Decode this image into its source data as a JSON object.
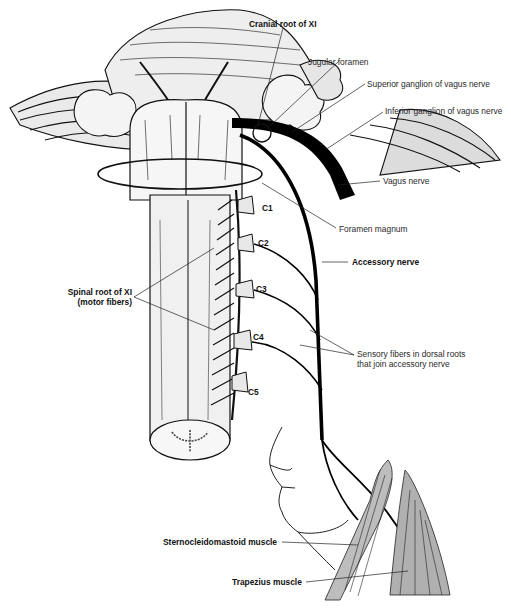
{
  "figure": {
    "colors": {
      "line": "#111111",
      "fill_light": "#efefef",
      "fill_mid": "#d8d8d8",
      "muscle": "#b8b8b8",
      "background": "#ffffff"
    }
  },
  "labels": {
    "cranial_root": "Cranial root of XI",
    "jugular_foramen": "Jugular foramen",
    "superior_ganglion": "Superior ganglion of vagus nerve",
    "inferior_ganglion": "Inferior ganglion of vagus nerve",
    "vagus_nerve": "Vagus nerve",
    "foramen_magnum": "Foramen magnum",
    "accessory_nerve": "Accessory nerve",
    "spinal_root_line1": "Spinal root of XI",
    "spinal_root_line2": "(motor fibers)",
    "sensory_line1": "Sensory fibers in dorsal roots",
    "sensory_line2": "that join accessory nerve",
    "sternocleidomastoid": "Sternocleidomastoid muscle",
    "trapezius": "Trapezius muscle",
    "c1": "C1",
    "c2": "C2",
    "c3": "C3",
    "c4": "C4",
    "c5": "C5"
  }
}
